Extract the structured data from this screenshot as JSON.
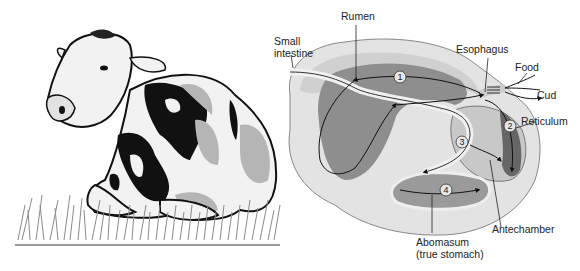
{
  "figure": {
    "left_panel": "cow-illustration",
    "right_panel": "ruminant-stomach-cutaway"
  },
  "labels": {
    "rumen": "Rumen",
    "small_intestine": "Small\nintestine",
    "esophagus": "Esophagus",
    "food": "Food",
    "cud": "Cud",
    "reticulum": "Reticulum",
    "antechamber": "Antechamber",
    "abomasum": "Abomasum\n(true stomach)"
  },
  "chambers": [
    {
      "number": "1",
      "name": "Rumen"
    },
    {
      "number": "2",
      "name": "Reticulum"
    },
    {
      "number": "3",
      "name": "Omasum"
    },
    {
      "number": "4",
      "name": "Abomasum"
    }
  ],
  "colors": {
    "outline": "#1a1a1a",
    "light_gray": "#d9d9d9",
    "mid_gray": "#a8a8a8",
    "dark_gray": "#7a7a7a",
    "spot_black": "#111111",
    "spot_gray": "#b5b5b5",
    "grass": "#8a8a8a"
  }
}
